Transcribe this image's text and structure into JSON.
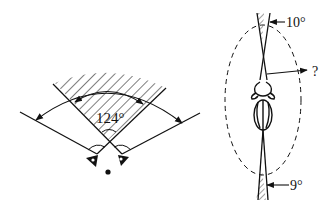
{
  "figure": {
    "left_panel": {
      "description": "Binocular visual field (top view)",
      "overlap_angle_label": "124°"
    },
    "right_panel": {
      "description": "Lateral visual field of insect (top view)",
      "front_blind_angle_label": "10°",
      "lateral_label": "?",
      "rear_blind_angle_label": "9°"
    }
  },
  "colors": {
    "stroke": "#111111",
    "background": "#ffffff"
  }
}
